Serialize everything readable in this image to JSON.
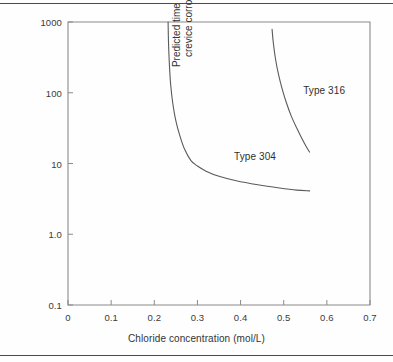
{
  "figure": {
    "background_color": "#fefefe",
    "rule_color": "#4a4a4a",
    "axis_color": "#8a8a8a",
    "curve_color": "#5a5a5a",
    "text_color": "#333333"
  },
  "chart_data": {
    "type": "line",
    "title": "",
    "xlabel": "Chloride concentration (mol/L)",
    "ylabel": "Predicted time to the onset of crevice corrosion (hours)",
    "ylabel_line1": "Predicted time to the onset of",
    "ylabel_line2": "crevice corrosion (hours)",
    "xscale": "linear",
    "yscale": "log",
    "xlim": [
      0,
      0.7
    ],
    "ylim": [
      0.1,
      1000
    ],
    "grid": false,
    "legend": "inline-annotations",
    "xticks": [
      0,
      0.1,
      0.2,
      0.3,
      0.4,
      0.5,
      0.6,
      0.7
    ],
    "xtick_labels": [
      "0",
      "0.1",
      "0.2",
      "0.3",
      "0.4",
      "0.5",
      "0.6",
      "0.7"
    ],
    "yticks": [
      1000,
      100,
      10,
      1.0,
      0.1
    ],
    "ytick_labels": [
      "1000",
      "100",
      "10",
      "1.0",
      "0.1"
    ],
    "series": [
      {
        "name": "Type 304",
        "annotation": "Type 304",
        "annotation_x": 0.385,
        "annotation_y": 12.5,
        "points": [
          [
            0.232,
            1000
          ],
          [
            0.233,
            500
          ],
          [
            0.235,
            250
          ],
          [
            0.238,
            130
          ],
          [
            0.243,
            70
          ],
          [
            0.25,
            40
          ],
          [
            0.259,
            25
          ],
          [
            0.27,
            16
          ],
          [
            0.285,
            11
          ],
          [
            0.3,
            9.2
          ],
          [
            0.32,
            7.8
          ],
          [
            0.35,
            6.6
          ],
          [
            0.39,
            5.7
          ],
          [
            0.44,
            5.0
          ],
          [
            0.49,
            4.5
          ],
          [
            0.53,
            4.2
          ],
          [
            0.56,
            4.1
          ]
        ]
      },
      {
        "name": "Type 316",
        "annotation": "Type 316",
        "annotation_x": 0.545,
        "annotation_y": 105,
        "points": [
          [
            0.473,
            790
          ],
          [
            0.476,
            500
          ],
          [
            0.481,
            300
          ],
          [
            0.488,
            180
          ],
          [
            0.497,
            110
          ],
          [
            0.507,
            70
          ],
          [
            0.518,
            46
          ],
          [
            0.531,
            31
          ],
          [
            0.543,
            22
          ],
          [
            0.553,
            17
          ],
          [
            0.56,
            14.5
          ]
        ]
      }
    ]
  }
}
